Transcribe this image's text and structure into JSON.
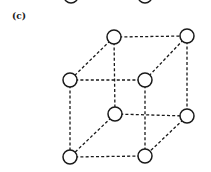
{
  "figure": {
    "label": "(c)",
    "colors": {
      "stroke": "#1a1a1a",
      "fill": "#ffffff"
    },
    "partial_nodes_top": [
      {
        "x": 71,
        "y": -4
      },
      {
        "x": 145,
        "y": -4
      }
    ],
    "nodes": [
      {
        "id": "top-back-left",
        "x": 114,
        "y": 37
      },
      {
        "id": "top-back-right",
        "x": 187,
        "y": 36
      },
      {
        "id": "top-front-left",
        "x": 70,
        "y": 80
      },
      {
        "id": "top-front-right",
        "x": 145,
        "y": 80
      },
      {
        "id": "bottom-back-left",
        "x": 115,
        "y": 114
      },
      {
        "id": "bottom-back-right",
        "x": 187,
        "y": 116
      },
      {
        "id": "bottom-front-left",
        "x": 70,
        "y": 157
      },
      {
        "id": "bottom-front-right",
        "x": 145,
        "y": 156
      }
    ],
    "node_radius": 7,
    "edges": [
      [
        "top-back-left",
        "top-back-right"
      ],
      [
        "top-front-left",
        "top-front-right"
      ],
      [
        "bottom-back-left",
        "bottom-back-right"
      ],
      [
        "bottom-front-left",
        "bottom-front-right"
      ],
      [
        "top-back-left",
        "top-front-left"
      ],
      [
        "top-back-right",
        "top-front-right"
      ],
      [
        "bottom-back-left",
        "bottom-front-left"
      ],
      [
        "bottom-back-right",
        "bottom-front-right"
      ],
      [
        "top-back-left",
        "bottom-back-left"
      ],
      [
        "top-back-right",
        "bottom-back-right"
      ],
      [
        "top-front-left",
        "bottom-front-left"
      ],
      [
        "top-front-right",
        "bottom-front-right"
      ]
    ]
  }
}
